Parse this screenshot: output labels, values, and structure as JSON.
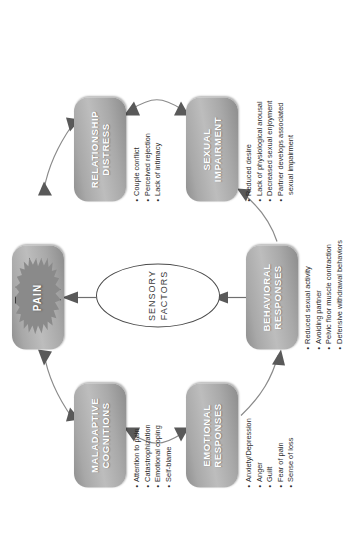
{
  "diagram": {
    "accent_box_color": "#a8a8a8",
    "arrow_color": "#595959",
    "text_color": "#2b2b2b"
  },
  "center": {
    "pain_label": "PAIN",
    "sensory_label": "SENSORY FACTORS"
  },
  "nodes": {
    "maladaptive": {
      "label": "MALADAPTIVE COGNITIONS",
      "bullets": [
        "Attention to pain",
        "Catastrophization",
        "Emotional coping",
        "Self-blame"
      ]
    },
    "emotional": {
      "label": "EMOTIONAL RESPONSES",
      "bullets": [
        "Anxiety/Depression",
        "Anger",
        "Guilt",
        "Fear of pain",
        "Sense of loss"
      ]
    },
    "behavioral": {
      "label": "BEHAVIORAL RESPONSES",
      "bullets": [
        "Reduced sexual activity",
        "Avoiding partner",
        "Pelvic floor muscle contraction",
        "Defensive withdrawal behaviors"
      ]
    },
    "sexual": {
      "label": "SEXUAL IMPAIRMENT",
      "bullets": [
        "Reduced desire",
        "Lack of physiological arousal",
        "Decreased sexual enjoyment",
        "Partner develops associated",
        "sexual impairment"
      ]
    },
    "relationship": {
      "label": "RELATIONSHIP DISTRESS",
      "bullets": [
        "Couple conflict",
        "Perceived rejection",
        "Lack of intimacy"
      ]
    }
  }
}
